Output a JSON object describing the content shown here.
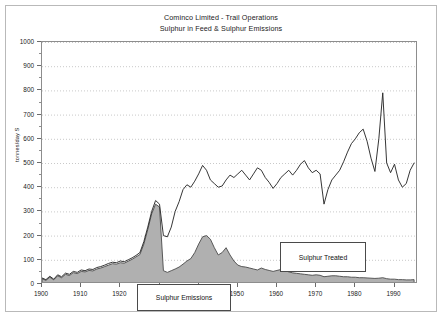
{
  "figure": {
    "title_line1": "Cominco Limited - Trail Operations",
    "title_line2": "Sulphur in Feed & Sulphur Emissions"
  },
  "annotations": {
    "emissions_label": "Sulphur Emissions",
    "treated_label": "Sulphur Treated"
  },
  "chart_data": {
    "type": "area",
    "title": "Cominco Limited - Trail Operations\nSulphur in Feed & Sulphur Emissions",
    "xlabel": "",
    "ylabel": "tonnes/day  S",
    "xlim": [
      1900,
      1996
    ],
    "ylim": [
      0,
      1000
    ],
    "grid": "horizontal-dotted",
    "legend_position": "none",
    "ytick_labels": [
      "0",
      "100",
      "200",
      "300",
      "400",
      "500",
      "600",
      "700",
      "800",
      "900",
      "1000"
    ],
    "ytick_values": [
      0,
      100,
      200,
      300,
      400,
      500,
      600,
      700,
      800,
      900,
      1000
    ],
    "xtick_labels": [
      "1900",
      "1910",
      "1920",
      "1930",
      "1940",
      "1950",
      "1960",
      "1970",
      "1980",
      "1990"
    ],
    "xtick_values": [
      1900,
      1910,
      1920,
      1930,
      1940,
      1950,
      1960,
      1970,
      1980,
      1990
    ],
    "series": [
      {
        "name": "Sulphur in Feed",
        "style": "line",
        "color": "#2b2b2b",
        "x": [
          1900,
          1901,
          1902,
          1903,
          1904,
          1905,
          1906,
          1907,
          1908,
          1909,
          1910,
          1911,
          1912,
          1913,
          1914,
          1915,
          1916,
          1917,
          1918,
          1919,
          1920,
          1921,
          1922,
          1923,
          1924,
          1925,
          1926,
          1927,
          1928,
          1929,
          1930,
          1931,
          1932,
          1933,
          1934,
          1935,
          1936,
          1937,
          1938,
          1939,
          1940,
          1941,
          1942,
          1943,
          1944,
          1945,
          1946,
          1947,
          1948,
          1949,
          1950,
          1951,
          1952,
          1953,
          1954,
          1955,
          1956,
          1957,
          1958,
          1959,
          1960,
          1961,
          1962,
          1963,
          1964,
          1965,
          1966,
          1967,
          1968,
          1969,
          1970,
          1971,
          1972,
          1973,
          1974,
          1975,
          1976,
          1977,
          1978,
          1979,
          1980,
          1981,
          1982,
          1983,
          1984,
          1985,
          1986,
          1987,
          1988,
          1989,
          1990,
          1991,
          1992,
          1993,
          1994,
          1995
        ],
        "values": [
          25,
          18,
          32,
          20,
          38,
          30,
          45,
          40,
          52,
          48,
          58,
          55,
          62,
          60,
          68,
          72,
          78,
          85,
          90,
          88,
          95,
          92,
          100,
          108,
          118,
          130,
          175,
          235,
          300,
          345,
          330,
          200,
          195,
          235,
          300,
          340,
          390,
          410,
          400,
          425,
          455,
          490,
          470,
          430,
          415,
          400,
          405,
          430,
          450,
          440,
          455,
          470,
          450,
          430,
          455,
          480,
          470,
          440,
          420,
          395,
          415,
          440,
          455,
          470,
          450,
          470,
          495,
          510,
          480,
          460,
          470,
          455,
          330,
          390,
          430,
          450,
          470,
          505,
          545,
          580,
          600,
          625,
          640,
          590,
          520,
          465,
          600,
          790,
          500,
          460,
          495,
          430,
          400,
          415,
          470,
          500
        ]
      },
      {
        "name": "Sulphur Emissions",
        "style": "filled-area",
        "color": "#b0b0b0",
        "edge_color": "#4a4a4a",
        "x": [
          1900,
          1901,
          1902,
          1903,
          1904,
          1905,
          1906,
          1907,
          1908,
          1909,
          1910,
          1911,
          1912,
          1913,
          1914,
          1915,
          1916,
          1917,
          1918,
          1919,
          1920,
          1921,
          1922,
          1923,
          1924,
          1925,
          1926,
          1927,
          1928,
          1929,
          1930,
          1931,
          1932,
          1933,
          1934,
          1935,
          1936,
          1937,
          1938,
          1939,
          1940,
          1941,
          1942,
          1943,
          1944,
          1945,
          1946,
          1947,
          1948,
          1949,
          1950,
          1951,
          1952,
          1953,
          1954,
          1955,
          1956,
          1957,
          1958,
          1959,
          1960,
          1961,
          1962,
          1963,
          1964,
          1965,
          1966,
          1967,
          1968,
          1969,
          1970,
          1971,
          1972,
          1973,
          1974,
          1975,
          1976,
          1977,
          1978,
          1979,
          1980,
          1981,
          1982,
          1983,
          1984,
          1985,
          1986,
          1987,
          1988,
          1989,
          1990,
          1991,
          1992,
          1993,
          1994,
          1995
        ],
        "values": [
          22,
          15,
          28,
          17,
          34,
          26,
          40,
          35,
          47,
          43,
          52,
          50,
          56,
          54,
          62,
          66,
          72,
          78,
          84,
          82,
          88,
          86,
          94,
          102,
          112,
          122,
          165,
          225,
          290,
          330,
          318,
          55,
          48,
          55,
          62,
          70,
          82,
          95,
          105,
          130,
          165,
          195,
          200,
          185,
          150,
          120,
          130,
          150,
          120,
          95,
          78,
          72,
          70,
          66,
          62,
          58,
          66,
          60,
          56,
          52,
          56,
          60,
          56,
          50,
          46,
          44,
          42,
          40,
          38,
          36,
          38,
          36,
          30,
          32,
          34,
          34,
          32,
          30,
          30,
          28,
          28,
          26,
          26,
          25,
          24,
          23,
          24,
          26,
          22,
          20,
          20,
          18,
          18,
          17,
          17,
          18
        ]
      }
    ],
    "annotations": [
      {
        "text": "Sulphur Emissions",
        "x": 1926,
        "y": 170
      },
      {
        "text": "Sulphur Treated",
        "x": 1962,
        "y": 300
      }
    ]
  }
}
